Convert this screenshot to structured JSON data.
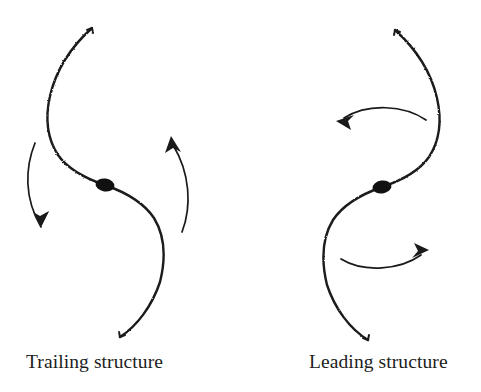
{
  "figure": {
    "background_color": "#ffffff",
    "ink_color": "#1a1a1a",
    "panels": [
      {
        "id": "trailing",
        "caption": "Trailing structure",
        "nucleus": {
          "cx": 105,
          "cy": 185,
          "rx": 9.5,
          "ry": 6.5,
          "color": "#111111"
        },
        "spiral_arms": [
          {
            "name": "upper-arm",
            "description": "arm sweeping up and to the left from the nucleus, tip at top",
            "start": [
              105,
              185
            ],
            "tip": [
              92,
              27
            ],
            "bulge_x": 47,
            "bulge_y": 128
          },
          {
            "name": "lower-arm",
            "description": "arm sweeping down and to the right from the nucleus, tail at bottom",
            "start": [
              105,
              185
            ],
            "tip": [
              120,
              337
            ],
            "bulge_x": 163,
            "bulge_y": 252
          }
        ],
        "rotation_arrows": [
          {
            "name": "left-rotation-arrow",
            "direction": "downward",
            "start": [
              35,
              143
            ],
            "end": [
              46,
              233
            ]
          },
          {
            "name": "right-rotation-arrow",
            "direction": "upward",
            "start": [
              182,
              232
            ],
            "end": [
              170,
              137
            ]
          }
        ],
        "rotation_sense": "clockwise"
      },
      {
        "id": "leading",
        "caption": "Leading structure",
        "nucleus": {
          "cx": 382,
          "cy": 187,
          "rx": 9.5,
          "ry": 6.5,
          "color": "#111111"
        },
        "spiral_arms": [
          {
            "name": "upper-arm",
            "description": "arm sweeping up and to the right from the nucleus, tip at top",
            "start": [
              382,
              187
            ],
            "tip": [
              395,
              28
            ],
            "bulge_x": 440,
            "bulge_y": 130
          },
          {
            "name": "lower-arm",
            "description": "arm sweeping down and to the left from the nucleus, tail at bottom",
            "start": [
              382,
              187
            ],
            "tip": [
              368,
              340
            ],
            "bulge_x": 324,
            "bulge_y": 254
          }
        ],
        "rotation_arrows": [
          {
            "name": "top-rotation-arrow",
            "direction": "leftward",
            "start": [
              425,
              119
            ],
            "end": [
              337,
              119
            ]
          },
          {
            "name": "bottom-rotation-arrow",
            "direction": "rightward",
            "start": [
              341,
              258
            ],
            "end": [
              428,
              252
            ]
          }
        ],
        "rotation_sense": "counter-clockwise"
      }
    ]
  },
  "captions": {
    "left": "Trailing structure",
    "right": "Leading structure"
  }
}
